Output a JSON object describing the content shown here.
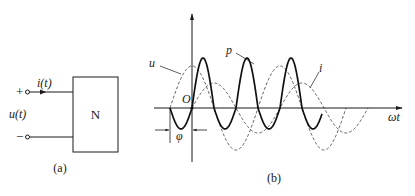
{
  "figure_a": {
    "caption": "(a)",
    "network_label": "N",
    "current_label": "i(t)",
    "voltage_label": "u(t)",
    "plus_sign": "+",
    "minus_sign": "−"
  },
  "figure_b": {
    "caption": "(b)",
    "origin_label": "O",
    "x_axis_label": "ωt",
    "phase_label": "φ",
    "curve_labels": {
      "u": "u",
      "i": "i",
      "p": "p"
    }
  },
  "chart_data": {
    "type": "line",
    "title": "",
    "xlabel": "ωt",
    "ylabel": "",
    "grid": false,
    "legend": "inline labels",
    "annotations": [
      "O (origin)",
      "φ (phase difference between u and i)"
    ],
    "series": [
      {
        "name": "u",
        "style": "dashed",
        "description": "voltage sinusoid, leads i by φ",
        "amplitude": 1.0,
        "phase_lead_rad": 1.43
      },
      {
        "name": "i",
        "style": "dashed",
        "description": "current sinusoid, starts at origin",
        "amplitude": 0.65,
        "phase_rad": 0
      },
      {
        "name": "p",
        "style": "solid bold",
        "description": "instantaneous power p = u·i, double frequency, mostly positive"
      }
    ],
    "x_range_periods": 2.0
  },
  "colors": {
    "ink": "#1a1a1a",
    "background": "#ffffff"
  }
}
